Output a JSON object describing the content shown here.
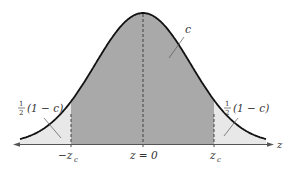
{
  "diagram": {
    "type": "normal-distribution-confidence-interval",
    "axis_label": "z",
    "center_label": "z = 0",
    "left_critical_label": "−z",
    "left_critical_sub": "c",
    "right_critical_label": "z",
    "right_critical_sub": "c",
    "center_area_label": "c",
    "left_tail_label": {
      "frac_num": "1",
      "frac_den": "2",
      "text": "(1 − c)"
    },
    "right_tail_label": {
      "frac_num": "1",
      "frac_den": "2",
      "text": "(1 − c)"
    },
    "colors": {
      "center_fill": "#a9a9a9",
      "tail_fill": "#e8e8e8",
      "curve": "#111111",
      "axis": "#555555"
    }
  }
}
